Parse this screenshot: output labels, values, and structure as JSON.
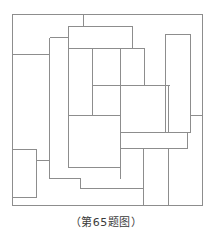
{
  "figure": {
    "caption": "（第65题图）",
    "top_artifact_text": "",
    "stroke_color": "#8d8d8d",
    "fill_color": "#ffffff",
    "background_color": "#ffffff",
    "stroke_width": 1,
    "view_box": "0 0 212 200",
    "outer_frame": {
      "x": 12,
      "y": 4,
      "width": 191,
      "height": 192
    },
    "rectangles": [
      {
        "id": "rect-outer-frame",
        "x": 12,
        "y": 4,
        "width": 191,
        "height": 192
      },
      {
        "id": "rect-top-center",
        "x": 68,
        "y": 16,
        "width": 64,
        "height": 22
      },
      {
        "id": "rect-upper-mid-tall",
        "x": 49,
        "y": 27,
        "width": 64,
        "height": 78
      },
      {
        "id": "rect-upper-right-wide",
        "x": 92,
        "y": 38,
        "width": 52,
        "height": 37
      },
      {
        "id": "rect-left-strip",
        "x": 12,
        "y": 44,
        "width": 37,
        "height": 0
      },
      {
        "id": "rect-right-tall",
        "x": 165,
        "y": 24,
        "width": 25,
        "height": 98
      },
      {
        "id": "rect-center-right-block",
        "x": 121,
        "y": 74,
        "width": 48,
        "height": 48
      },
      {
        "id": "rect-center-lower",
        "x": 68,
        "y": 105,
        "width": 52,
        "height": 52
      },
      {
        "id": "rect-right-wide-low",
        "x": 121,
        "y": 122,
        "width": 67,
        "height": 16
      },
      {
        "id": "rect-left-small",
        "x": 12,
        "y": 139,
        "width": 24,
        "height": 48
      },
      {
        "id": "rect-bottom-mid",
        "x": 80,
        "y": 168,
        "width": 63,
        "height": 0
      },
      {
        "id": "rect-bottom-right",
        "x": 143,
        "y": 138,
        "width": 25,
        "height": 58
      }
    ],
    "segments": [
      {
        "id": "seg-top-tick-vertical",
        "x1": 83,
        "y1": 4,
        "x2": 83,
        "y2": 16
      },
      {
        "id": "seg-left-horizontal-44",
        "x1": 12,
        "y1": 44,
        "x2": 49,
        "y2": 44
      },
      {
        "id": "seg-mid-vertical-92",
        "x1": 92,
        "y1": 38,
        "x2": 92,
        "y2": 105
      },
      {
        "id": "seg-horizontal-75",
        "x1": 92,
        "y1": 75,
        "x2": 169,
        "y2": 75
      },
      {
        "id": "seg-vertical-120-right",
        "x1": 120,
        "y1": 105,
        "x2": 120,
        "y2": 168
      },
      {
        "id": "seg-right-tab-105",
        "x1": 190,
        "y1": 105,
        "x2": 203,
        "y2": 105
      },
      {
        "id": "seg-lower-left-tab",
        "x1": 36,
        "y1": 150,
        "x2": 49,
        "y2": 150
      },
      {
        "id": "seg-vertical-49-long",
        "x1": 49,
        "y1": 27,
        "x2": 49,
        "y2": 168
      },
      {
        "id": "seg-bottom-step-h",
        "x1": 49,
        "y1": 168,
        "x2": 80,
        "y2": 168
      },
      {
        "id": "seg-bottom-step-v",
        "x1": 80,
        "y1": 168,
        "x2": 80,
        "y2": 178
      },
      {
        "id": "seg-bottom-long-h",
        "x1": 80,
        "y1": 178,
        "x2": 143,
        "y2": 178
      },
      {
        "id": "seg-bottom-right-v",
        "x1": 143,
        "y1": 138,
        "x2": 143,
        "y2": 196
      },
      {
        "id": "seg-bottom-far-right-v",
        "x1": 168,
        "y1": 138,
        "x2": 168,
        "y2": 196
      },
      {
        "id": "seg-right-lower-h",
        "x1": 169,
        "y1": 138,
        "x2": 188,
        "y2": 138
      },
      {
        "id": "seg-center-low-h",
        "x1": 120,
        "y1": 138,
        "x2": 143,
        "y2": 138
      }
    ]
  }
}
